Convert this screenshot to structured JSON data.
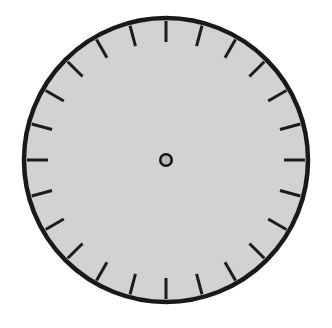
{
  "figure": {
    "kind": "dial-diagram",
    "canvas_width": 332,
    "canvas_height": 328,
    "background_color": "#ffffff"
  },
  "dial": {
    "name": "clock-dial-face",
    "center_x": 166,
    "center_y": 160,
    "radius": 142,
    "face_fill_color": "#d2d2d2",
    "rim_stroke_color": "#191919",
    "rim_stroke_width": 4.5
  },
  "ticks": {
    "count": 24,
    "step_degrees": 15,
    "start_angle_degrees": 0,
    "length": 21,
    "thickness": 3,
    "color": "#1c1c1c",
    "inset_from_rim": 3,
    "angles_degrees": [
      0,
      15,
      30,
      45,
      60,
      75,
      90,
      105,
      120,
      135,
      150,
      165,
      180,
      195,
      210,
      225,
      240,
      255,
      270,
      285,
      300,
      315,
      330,
      345
    ]
  },
  "hub": {
    "name": "center-hub",
    "center_x": 166,
    "center_y": 160,
    "outer_radius": 7,
    "inner_radius": 4.5,
    "ring_color": "#121212",
    "fill_color": "#b8b8b8"
  },
  "chart_data": {
    "type": "scatter",
    "xlabel": "",
    "ylabel": "",
    "categories": [
      "0°",
      "15°",
      "30°",
      "45°",
      "60°",
      "75°",
      "90°",
      "105°",
      "120°",
      "135°",
      "150°",
      "165°",
      "180°",
      "195°",
      "210°",
      "225°",
      "240°",
      "255°",
      "270°",
      "285°",
      "300°",
      "315°",
      "330°",
      "345°"
    ],
    "values": [
      1,
      1,
      1,
      1,
      1,
      1,
      1,
      1,
      1,
      1,
      1,
      1,
      1,
      1,
      1,
      1,
      1,
      1,
      1,
      1,
      1,
      1,
      1,
      1
    ],
    "legend": [],
    "grid": false
  }
}
